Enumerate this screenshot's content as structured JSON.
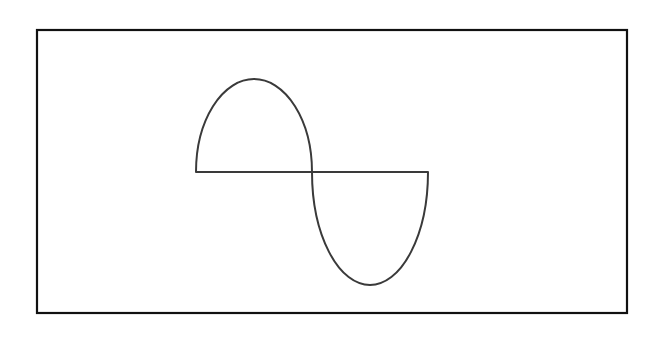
{
  "canvas": {
    "width": 662,
    "height": 337,
    "background": "#ffffff"
  },
  "frame": {
    "x": 37,
    "y": 30,
    "width": 590,
    "height": 283,
    "stroke": "#111111",
    "stroke_width": 2.2
  },
  "curve": {
    "stroke": "#3a3a3a",
    "stroke_width": 2,
    "baseline_y": 172,
    "left_x": 196,
    "center_x": 312,
    "right_x": 428,
    "upper_lobe": {
      "cx": 254,
      "rx": 58,
      "ry": 93,
      "peak_y": 79
    },
    "lower_lobe": {
      "cx": 370,
      "rx": 58,
      "ry": 113,
      "trough_y": 285
    }
  }
}
